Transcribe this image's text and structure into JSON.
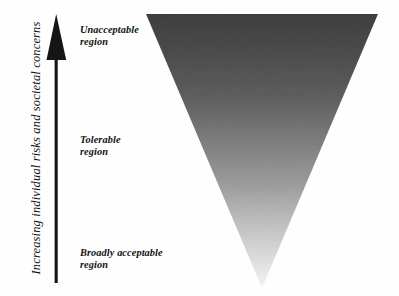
{
  "diagram": {
    "background_color": "#fefefe"
  },
  "axis": {
    "label": "Increasing individual risks and societal concerns",
    "arrow_direction": "up",
    "arrow_color": "#151515",
    "arrow_icon": "up-arrow-icon"
  },
  "regions": [
    {
      "key": "unacceptable",
      "label": "Unacceptable\nregion",
      "line1": "Unacceptable",
      "line2": "region",
      "shade_hex": "#474747"
    },
    {
      "key": "tolerable",
      "label": "Tolerable\nregion",
      "line1": "Tolerable",
      "line2": "region",
      "shade_hex": "#8b8b8b"
    },
    {
      "key": "broadly_acceptable",
      "label": "Broadly acceptable\nregion",
      "line1": "Broadly acceptable",
      "line2": "region",
      "shade_hex": "#e2e2e2"
    }
  ],
  "triangle": {
    "shape": "inverted-triangle",
    "gradient_top_hex": "#444444",
    "gradient_mid_hex": "#8e8e8e",
    "gradient_bottom_hex": "#f2f2f2",
    "top_left_x": 146,
    "top_right_x": 378,
    "top_y": 14,
    "apex_x": 262,
    "apex_y": 288
  }
}
